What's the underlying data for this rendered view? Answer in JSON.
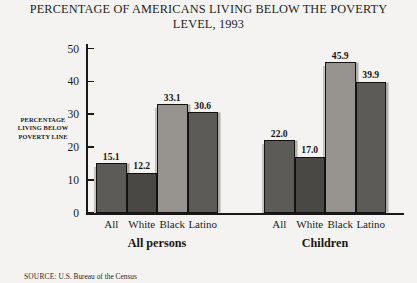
{
  "chart_data": {
    "type": "bar",
    "title": "PERCENTAGE OF AMERICANS LIVING BELOW THE POVERTY LEVEL, 1993",
    "title_lines": [
      "PERCENTAGE OF AMERICANS LIVING BELOW THE POVERTY",
      "LEVEL, 1993"
    ],
    "xlabel": "",
    "ylabel": "PERCENTAGE LIVING BELOW POVERTY LINE",
    "ylabel_lines": [
      "PERCENTAGE",
      "LIVING BELOW",
      "POVERTY LINE"
    ],
    "ylim": [
      0,
      50
    ],
    "yticks": [
      0,
      10,
      20,
      30,
      40,
      50
    ],
    "ytick_labels": [
      "0",
      "10",
      "20",
      "30",
      "40",
      "50"
    ],
    "grid": false,
    "legend": "none",
    "categories": [
      "All",
      "White",
      "Black",
      "Latino"
    ],
    "groups": [
      {
        "name": "All persons",
        "bars": [
          {
            "category": "All",
            "value": 15.1,
            "label": "15.1",
            "color": "#5d5b58"
          },
          {
            "category": "White",
            "value": 12.2,
            "label": "12.2",
            "color": "#4a4845"
          },
          {
            "category": "Black",
            "value": 33.1,
            "label": "33.1",
            "color": "#97948f"
          },
          {
            "category": "Latino",
            "value": 30.6,
            "label": "30.6",
            "color": "#5d5b58"
          }
        ]
      },
      {
        "name": "Children",
        "bars": [
          {
            "category": "All",
            "value": 22.0,
            "label": "22.0",
            "color": "#5d5b58"
          },
          {
            "category": "White",
            "value": 17.0,
            "label": "17.0",
            "color": "#4a4845"
          },
          {
            "category": "Black",
            "value": 45.9,
            "label": "45.9",
            "color": "#97948f"
          },
          {
            "category": "Latino",
            "value": 39.9,
            "label": "39.9",
            "color": "#5d5b58"
          }
        ]
      }
    ]
  },
  "source": {
    "label": "SOURCE:",
    "text": "U.S. Bureau of the Census"
  },
  "colors": {
    "background": "#f4f3f1",
    "axis": "#1a1816",
    "text": "#1c1a18",
    "bar_medium": "#5d5b58",
    "bar_dark": "#4a4845",
    "bar_light": "#97948f"
  }
}
